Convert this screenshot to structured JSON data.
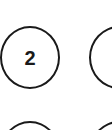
{
  "keypad": {
    "keys": [
      {
        "label": "2"
      },
      {
        "label": ""
      },
      {
        "label": ""
      },
      {
        "label": ""
      }
    ]
  },
  "colors": {
    "background": "#ffffff",
    "stroke": "#1a1a1a",
    "text": "#1a1a1a"
  }
}
